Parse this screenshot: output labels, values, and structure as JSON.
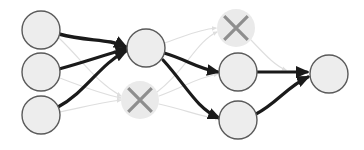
{
  "diagram": {
    "canvas": {
      "width": 364,
      "height": 150,
      "background": "#ffffff"
    },
    "colors": {
      "node_fill": "#ededed",
      "node_stroke": "#5a5a5a",
      "pruned_fill": "#eaeaea",
      "pruned_cross": "#8e8e8e",
      "edge_active": "#1a1a1a",
      "edge_pruned": "#dedede"
    },
    "nodes": [
      {
        "id": "in-1",
        "label": "",
        "state": "active",
        "cx": 41,
        "cy": 30,
        "r": 19
      },
      {
        "id": "in-2",
        "label": "",
        "state": "active",
        "cx": 41,
        "cy": 72,
        "r": 19
      },
      {
        "id": "in-3",
        "label": "",
        "state": "active",
        "cx": 41,
        "cy": 115,
        "r": 19
      },
      {
        "id": "hub",
        "label": "",
        "state": "active",
        "cx": 146,
        "cy": 48,
        "r": 19
      },
      {
        "id": "pruned-mid",
        "label": "✕",
        "state": "pruned",
        "cx": 140,
        "cy": 100,
        "r": 19
      },
      {
        "id": "pruned-top",
        "label": "✕",
        "state": "pruned",
        "cx": 236,
        "cy": 28,
        "r": 19
      },
      {
        "id": "mid-1",
        "label": "",
        "state": "active",
        "cx": 238,
        "cy": 72,
        "r": 19
      },
      {
        "id": "mid-2",
        "label": "",
        "state": "active",
        "cx": 238,
        "cy": 120,
        "r": 19
      },
      {
        "id": "out-1",
        "label": "",
        "state": "active",
        "cx": 329,
        "cy": 74,
        "r": 19
      }
    ],
    "edges": [
      {
        "from": "in-1",
        "to": "hub",
        "state": "active",
        "weight": 3.4,
        "path": "M 59 34 C 88 42 108 38 126 47",
        "arrow": true
      },
      {
        "from": "in-2",
        "to": "hub",
        "state": "active",
        "weight": 3.0,
        "path": "M 59 69 C 85 62 104 55 126 49",
        "arrow": true
      },
      {
        "from": "in-3",
        "to": "hub",
        "state": "active",
        "weight": 3.2,
        "path": "M 58 107 C 86 92 100 64 126 51",
        "arrow": true
      },
      {
        "from": "in-1",
        "to": "pruned-mid",
        "state": "pruned",
        "path": "M 59 38 C 84 62 96 82 121 96",
        "arrow": true
      },
      {
        "from": "in-2",
        "to": "pruned-mid",
        "state": "pruned",
        "path": "M 60 78 C 84 87 98 93 121 98",
        "arrow": true
      },
      {
        "from": "in-3",
        "to": "pruned-mid",
        "state": "pruned",
        "path": "M 60 112 C 84 107 98 103 121 100",
        "arrow": true
      },
      {
        "from": "hub",
        "to": "pruned-top",
        "state": "pruned",
        "path": "M 164 43 C 186 36 196 30 216 28",
        "arrow": true
      },
      {
        "from": "hub",
        "to": "mid-1",
        "state": "active",
        "weight": 3.2,
        "path": "M 164 53 C 188 60 196 68 218 72",
        "arrow": true
      },
      {
        "from": "hub",
        "to": "mid-2",
        "state": "active",
        "weight": 3.2,
        "path": "M 163 60 C 186 85 196 108 219 118",
        "arrow": true
      },
      {
        "from": "pruned-mid",
        "to": "pruned-top",
        "state": "pruned",
        "path": "M 157 92 C 186 70 196 42 217 32",
        "arrow": true
      },
      {
        "from": "pruned-mid",
        "to": "mid-1",
        "state": "pruned",
        "path": "M 159 96 C 186 86 196 78 218 74",
        "arrow": true
      },
      {
        "from": "pruned-mid",
        "to": "mid-2",
        "state": "pruned",
        "path": "M 159 104 C 186 110 198 116 219 119",
        "arrow": true
      },
      {
        "from": "pruned-top",
        "to": "out-1",
        "state": "pruned",
        "path": "M 251 40 C 268 58 276 66 286 70",
        "arrow": true
      },
      {
        "from": "mid-1",
        "to": "out-1",
        "state": "active",
        "weight": 3.2,
        "path": "M 257 72 L 307 72",
        "arrow": true
      },
      {
        "from": "mid-2",
        "to": "out-1",
        "state": "active",
        "weight": 3.2,
        "path": "M 256 114 C 276 104 288 86 308 77",
        "arrow": true
      }
    ]
  }
}
